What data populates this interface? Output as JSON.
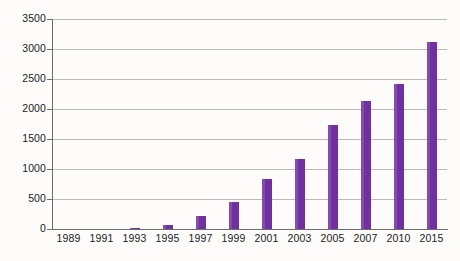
{
  "chart_data": {
    "type": "bar",
    "title": "",
    "subtitle": "",
    "xlabel": "",
    "ylabel": "",
    "categories": [
      "1989",
      "1991",
      "1993",
      "1995",
      "1997",
      "1999",
      "2001",
      "2003",
      "2005",
      "2007",
      "2010",
      "2015"
    ],
    "values": [
      0,
      0,
      25,
      60,
      210,
      450,
      830,
      1160,
      1730,
      2130,
      2420,
      3110
    ],
    "series": [
      {
        "name": "",
        "values": [
          0,
          0,
          25,
          60,
          210,
          450,
          830,
          1160,
          1730,
          2130,
          2420,
          3110
        ]
      }
    ],
    "ylim": [
      0,
      3500
    ],
    "yticks": [
      0,
      500,
      1000,
      1500,
      2000,
      2500,
      3000,
      3500
    ],
    "ytick_labels": [
      "0",
      "500",
      "1000",
      "1500",
      "2000",
      "2500",
      "3000",
      "3500"
    ],
    "grid": true,
    "legend": false,
    "legend_position": "none",
    "bar_color": "#7030a0",
    "gridline_color": "#b9b9b9",
    "axis_color": "#6d6d6d",
    "background_color": "#fdfcfa",
    "annotations": []
  }
}
